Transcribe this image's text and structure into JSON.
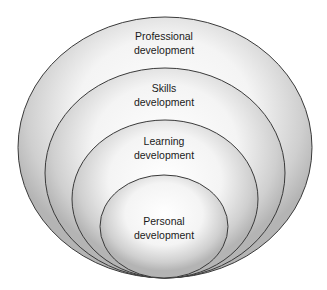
{
  "diagram": {
    "type": "nested-ellipses",
    "layers": [
      {
        "id": "professional",
        "label_line1": "Professional",
        "label_line2": "development"
      },
      {
        "id": "skills",
        "label_line1": "Skills",
        "label_line2": "development"
      },
      {
        "id": "learning",
        "label_line1": "Learning",
        "label_line2": "development"
      },
      {
        "id": "personal",
        "label_line1": "Personal",
        "label_line2": "development"
      }
    ],
    "colors": {
      "fill_center": "#ffffff",
      "fill_edge": "#b4b4b4",
      "stroke": "#3a3a3a"
    }
  }
}
